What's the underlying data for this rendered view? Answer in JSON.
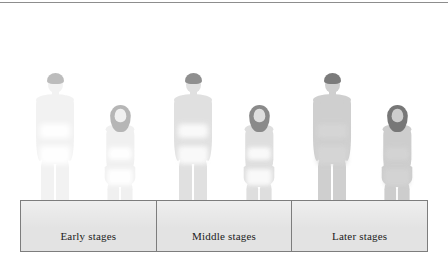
{
  "figure_caption": "",
  "legend": {
    "cells": [
      {
        "label": "Early stages"
      },
      {
        "label": "Middle stages"
      },
      {
        "label": "Later stages"
      }
    ]
  },
  "colors": {
    "box_fill": "#e3e3e3",
    "box_border": "#7d7d7d",
    "label_text": "#1b1b1b",
    "top_rule": "#8d8d8d",
    "background": "#ffffff"
  },
  "people": [
    {
      "name": "early-stage-male",
      "sex": "male",
      "stage": "Early stages",
      "body_color": "#f2f2f2",
      "hair_color": "#b9b9b9",
      "band_color": "#ffffff",
      "opacity": 0.95,
      "left": 30,
      "scale": 1.0
    },
    {
      "name": "early-stage-female",
      "sex": "female",
      "stage": "Early stages",
      "body_color": "#f0f0f0",
      "hair_color": "#b3b3b3",
      "band_color": "#ffffff",
      "opacity": 0.95,
      "left": 98,
      "scale": 0.9
    },
    {
      "name": "middle-stage-male",
      "sex": "male",
      "stage": "Middle stages",
      "body_color": "#e0e0e0",
      "hair_color": "#8f8f8f",
      "band_color": "#fbfbfb",
      "opacity": 1,
      "left": 168,
      "scale": 1.0
    },
    {
      "name": "middle-stage-female",
      "sex": "female",
      "stage": "Middle stages",
      "body_color": "#dedede",
      "hair_color": "#8a8a8a",
      "band_color": "#fbfbfb",
      "opacity": 1,
      "left": 237,
      "scale": 0.9
    },
    {
      "name": "later-stage-male",
      "sex": "male",
      "stage": "Later stages",
      "body_color": "#cfcfcf",
      "hair_color": "#7b7b7b",
      "band_color": "#d6d6d6",
      "opacity": 1,
      "left": 307,
      "scale": 1.0
    },
    {
      "name": "later-stage-female",
      "sex": "female",
      "stage": "Later stages",
      "body_color": "#cdcdcd",
      "hair_color": "#777777",
      "band_color": "#d4d4d4",
      "opacity": 1,
      "left": 375,
      "scale": 0.9
    }
  ]
}
